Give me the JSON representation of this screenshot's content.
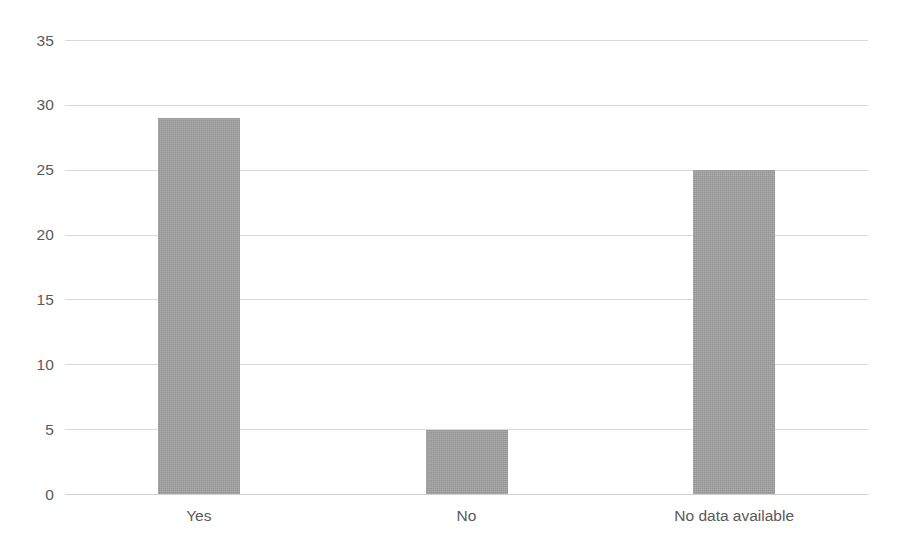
{
  "chart_data": {
    "type": "bar",
    "title": "",
    "subtitle": "",
    "xlabel": "",
    "ylabel": "",
    "categories": [
      "Yes",
      "No",
      "No data available"
    ],
    "values": [
      29,
      5,
      25
    ],
    "ylim": [
      0,
      35
    ],
    "y_ticks": [
      "0",
      "5",
      "10",
      "15",
      "20",
      "25",
      "30",
      "35"
    ],
    "y_tick_values": [
      0,
      5,
      10,
      15,
      20,
      25,
      30,
      35
    ],
    "grid": true,
    "grid_axis": "y",
    "legend": false,
    "legend_position": "none",
    "series": [
      {
        "name": "",
        "values": [
          29,
          5,
          25
        ]
      }
    ],
    "colors": {
      "bar_fill": "#a2a2a2",
      "gridline": "#d9d9d9",
      "tick_label": "#595959",
      "background": "#ffffff"
    }
  }
}
